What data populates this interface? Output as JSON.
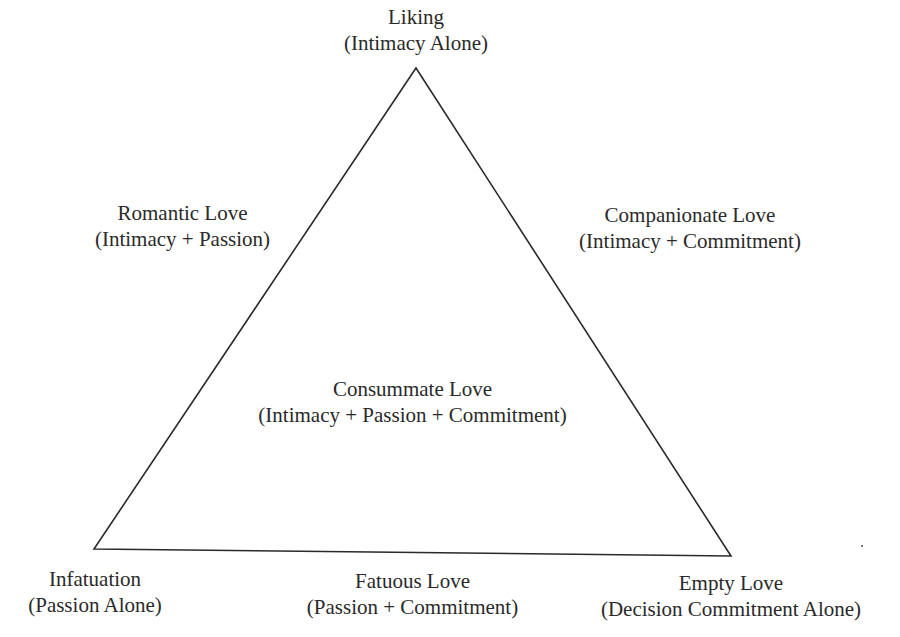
{
  "diagram": {
    "vertices": {
      "top": {
        "name": "Liking",
        "desc": "(Intimacy Alone)"
      },
      "bottom_left": {
        "name": "Infatuation",
        "desc": "(Passion Alone)"
      },
      "bottom_right": {
        "name": "Empty Love",
        "desc": "(Decision Commitment Alone)"
      }
    },
    "edges": {
      "left": {
        "name": "Romantic Love",
        "desc": "(Intimacy + Passion)"
      },
      "right": {
        "name": "Companionate Love",
        "desc": "(Intimacy + Commitment)"
      },
      "bottom": {
        "name": "Fatuous Love",
        "desc": "(Passion + Commitment)"
      }
    },
    "center": {
      "name": "Consummate Love",
      "desc": "(Intimacy + Passion + Commitment)"
    },
    "line_color": "#2a2a2a"
  }
}
